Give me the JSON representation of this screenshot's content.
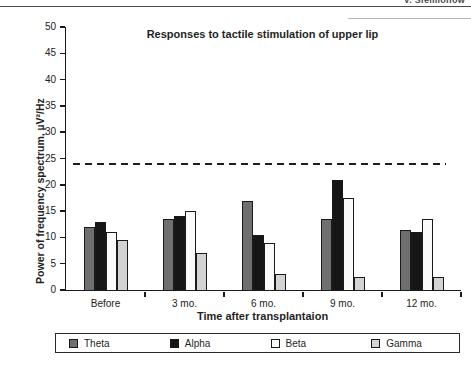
{
  "page_header": {
    "author_text": "V. Siemionow"
  },
  "chart_data": {
    "type": "bar",
    "title": "Responses to tactile stimulation of upper lip",
    "categories": [
      "Before",
      "3 mo.",
      "6 mo.",
      "9 mo.",
      "12 mo."
    ],
    "series": [
      {
        "name": "Theta",
        "color": "#6f6f6f",
        "values": [
          12,
          13.5,
          17,
          13.5,
          11.5
        ]
      },
      {
        "name": "Alpha",
        "color": "#161616",
        "values": [
          13,
          14,
          10.5,
          21,
          11
        ]
      },
      {
        "name": "Beta",
        "color": "#fafafa",
        "values": [
          11,
          15,
          9,
          17.5,
          13.5
        ]
      },
      {
        "name": "Gamma",
        "color": "#d3d3d3",
        "values": [
          9.5,
          7,
          3,
          2.5,
          2.5
        ]
      }
    ],
    "xlabel": "Time after transplantaion",
    "ylabel": "Power of frequency spectrum, µV²/Hz",
    "ylim": [
      0,
      50
    ],
    "ytick_step": 5,
    "reference_line": {
      "value": 24,
      "style": "dashed"
    },
    "legend_position": "bottom",
    "grid": false
  }
}
